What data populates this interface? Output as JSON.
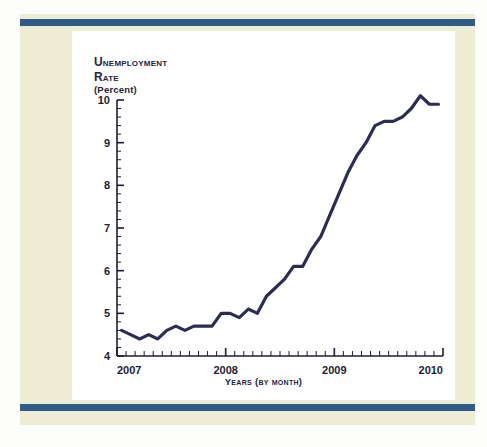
{
  "page": {
    "background_color": "#eeecd2",
    "rule_color": "#2e5c86",
    "panel_color": "#ffffff"
  },
  "chart_titles": {
    "line1": "Unemployment",
    "line2": "Rate",
    "line3": "(Percent)",
    "xcaption": "Years (by month)"
  },
  "chart_data": {
    "type": "line",
    "title": "Unemployment Rate (Percent)",
    "subtitle": "",
    "xlabel": "Years (by month)",
    "ylabel": "Unemployment Rate (Percent)",
    "line_color": "#2b2d52",
    "grid": false,
    "legend": "none",
    "xlim": [
      2007.0,
      2010.0
    ],
    "ylim": [
      4,
      10
    ],
    "ytick_labels": [
      "4",
      "5",
      "6",
      "7",
      "8",
      "9",
      "10"
    ],
    "ytick_values": [
      4,
      5,
      6,
      7,
      8,
      9,
      10
    ],
    "xtick_labels": [
      "2007",
      "2008",
      "2009",
      "2010"
    ],
    "xtick_values": [
      2007,
      2008,
      2009,
      2010
    ],
    "minor_ticks": "monthly",
    "x": [
      "2007-01",
      "2007-02",
      "2007-03",
      "2007-04",
      "2007-05",
      "2007-06",
      "2007-07",
      "2007-08",
      "2007-09",
      "2007-10",
      "2007-11",
      "2007-12",
      "2008-01",
      "2008-02",
      "2008-03",
      "2008-04",
      "2008-05",
      "2008-06",
      "2008-07",
      "2008-08",
      "2008-09",
      "2008-10",
      "2008-11",
      "2008-12",
      "2009-01",
      "2009-02",
      "2009-03",
      "2009-04",
      "2009-05",
      "2009-06",
      "2009-07",
      "2009-08",
      "2009-09",
      "2009-10",
      "2009-11",
      "2009-12"
    ],
    "values": [
      4.6,
      4.5,
      4.4,
      4.5,
      4.4,
      4.6,
      4.7,
      4.6,
      4.7,
      4.7,
      4.7,
      5.0,
      5.0,
      4.9,
      5.1,
      5.0,
      5.4,
      5.6,
      5.8,
      6.1,
      6.1,
      6.5,
      6.8,
      7.3,
      7.8,
      8.3,
      8.7,
      9.0,
      9.4,
      9.5,
      9.5,
      9.6,
      9.8,
      10.1,
      9.9,
      9.9
    ]
  }
}
